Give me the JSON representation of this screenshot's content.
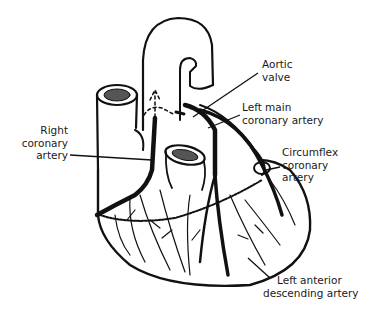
{
  "diagram": {
    "labels": {
      "aortic_valve": [
        "Aortic",
        "valve"
      ],
      "left_main": [
        "Left main",
        "coronary artery"
      ],
      "right_coronary": [
        "Right",
        "coronary",
        "artery"
      ],
      "circumflex": [
        "Circumflex",
        "coronary",
        "artery"
      ],
      "lad": [
        "Left anterior",
        "descending artery"
      ]
    },
    "colors": {
      "ink": "#111111",
      "background": "#ffffff"
    }
  }
}
